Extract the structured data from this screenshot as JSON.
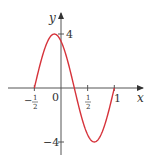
{
  "chart_data": {
    "type": "line",
    "title": "",
    "xlabel": "x",
    "ylabel": "y",
    "function": "y = 4 sin((4π/3)(x + 1/2))",
    "x_range": [
      -0.5,
      1.0
    ],
    "xlim": [
      -1.0,
      1.45
    ],
    "ylim": [
      -5.0,
      5.5
    ],
    "grid": false,
    "x_ticks": [
      {
        "value": -0.5,
        "label_num": "1",
        "label_den": "2",
        "sign": "−"
      },
      {
        "value": 0.5,
        "label_num": "1",
        "label_den": "2",
        "sign": ""
      },
      {
        "value": 1,
        "label": "1"
      }
    ],
    "y_ticks": [
      {
        "value": 4,
        "label": "4"
      },
      {
        "value": -4,
        "label": "−4"
      }
    ],
    "origin_label": "0",
    "series": [
      {
        "name": "f(x)",
        "color": "#d6333b",
        "x": [
          -0.5,
          -0.375,
          -0.25,
          -0.125,
          0,
          0.125,
          0.25,
          0.375,
          0.5,
          0.625,
          0.75,
          0.875,
          1.0
        ],
        "values": [
          0,
          2.0,
          3.46,
          4.0,
          3.46,
          2.0,
          0,
          -2.0,
          -3.46,
          -4.0,
          -3.46,
          -2.0,
          0
        ]
      }
    ],
    "key_points": {
      "max": {
        "x": -0.125,
        "y": 4
      },
      "min": {
        "x": 0.625,
        "y": -4
      },
      "zeros": [
        -0.5,
        0.25,
        1.0
      ]
    }
  },
  "colors": {
    "curve": "#d6333b",
    "axis": "#444444"
  }
}
